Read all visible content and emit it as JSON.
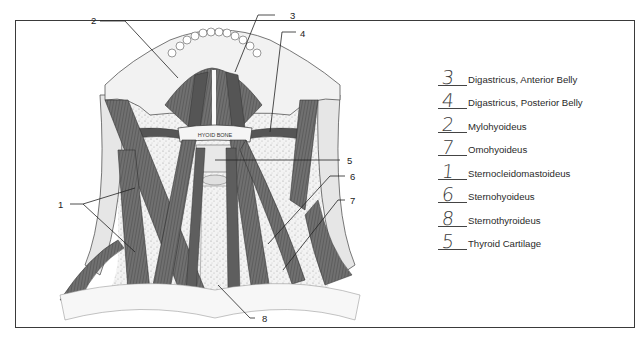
{
  "figure": {
    "bone_label": "HYOID BONE",
    "callouts": [
      "1",
      "2",
      "3",
      "4",
      "5",
      "6",
      "7",
      "8"
    ]
  },
  "legend": {
    "items": [
      {
        "answer": "3",
        "term": "Digastricus, Anterior Belly"
      },
      {
        "answer": "4",
        "term": "Digastricus, Posterior Belly"
      },
      {
        "answer": "2",
        "term": "Mylohyoideus"
      },
      {
        "answer": "7",
        "term": "Omohyoideus"
      },
      {
        "answer": "1",
        "term": "Sternocleidomastoideus"
      },
      {
        "answer": "6",
        "term": "Sternohyoideus"
      },
      {
        "answer": "8",
        "term": "Sternothyroideus"
      },
      {
        "answer": "5",
        "term": "Thyroid Cartilage"
      }
    ]
  },
  "colors": {
    "muscle": "#6b6b6b",
    "muscle_dark": "#4a4a4a",
    "bone": "#eeeeee",
    "stipple": "#d9d9d9",
    "line": "#222222"
  }
}
